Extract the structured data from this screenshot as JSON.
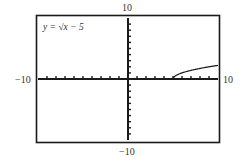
{
  "chart_data": {
    "type": "line",
    "title": "",
    "equation_label": "y = √x − 5",
    "function": "sqrt(x-5)",
    "xlim": [
      -10,
      10
    ],
    "ylim": [
      -10,
      10
    ],
    "xscale": 1,
    "yscale": 1,
    "grid": false,
    "axis_labels": {
      "xmin": "−10",
      "xmax": "10",
      "ymin": "−10",
      "ymax": "10"
    },
    "series": [
      {
        "name": "y = √(x − 5)",
        "x": [
          5,
          5.25,
          5.5,
          6,
          6.5,
          7,
          7.5,
          8,
          8.5,
          9,
          9.5,
          10
        ],
        "y": [
          0,
          0.5,
          0.71,
          1,
          1.22,
          1.41,
          1.58,
          1.73,
          1.87,
          2,
          2.12,
          2.24
        ]
      }
    ],
    "colors": {
      "frame": "#1a1a1a",
      "axes": "#1a1a1a",
      "curve": "#1a1a1a"
    }
  }
}
